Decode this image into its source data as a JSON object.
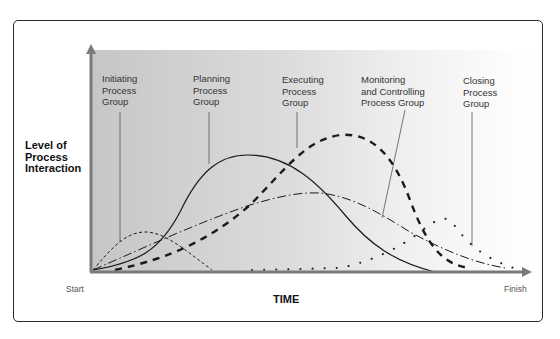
{
  "diagram": {
    "y_axis_label": "Level of\nProcess\nInteraction",
    "x_axis_label": "TIME",
    "x_start_label": "Start",
    "x_end_label": "Finish",
    "groups": [
      {
        "id": "initiating",
        "label": "Initiating\nProcess\nGroup",
        "line_style": "short-dashed"
      },
      {
        "id": "planning",
        "label": "Planning\nProcess\nGroup",
        "line_style": "solid"
      },
      {
        "id": "executing",
        "label": "Executing\nProcess\nGroup",
        "line_style": "heavy-dashed"
      },
      {
        "id": "monitoring",
        "label": "Monitoring\nand Controlling\nProcess Group",
        "line_style": "dash-dot"
      },
      {
        "id": "closing",
        "label": "Closing\nProcess\nGroup",
        "line_style": "dotted"
      }
    ],
    "colors": {
      "frame": "#2b2b2b",
      "axis": "#7a7a7a",
      "plot_bg_left": "#c9c9c9",
      "plot_bg_right": "#ffffff",
      "curve": "#1a1a1a",
      "leader": "#555555"
    }
  }
}
